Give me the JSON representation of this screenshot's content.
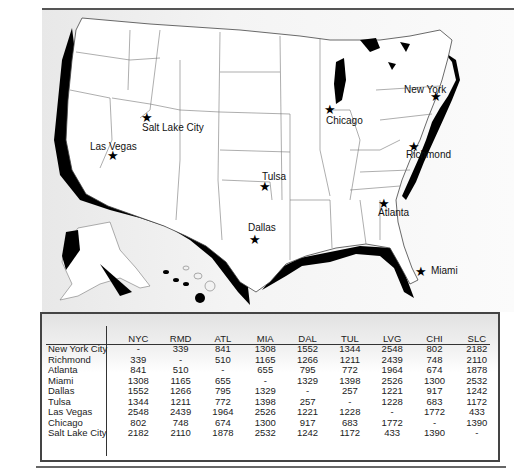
{
  "map": {
    "cities": [
      {
        "name": "Salt Lake City",
        "label_x": 142,
        "label_y": 128,
        "star_x": 147,
        "star_y": 117
      },
      {
        "name": "Las Vegas",
        "label_x": 90,
        "label_y": 147,
        "star_x": 113,
        "star_y": 155
      },
      {
        "name": "Chicago",
        "label_x": 326,
        "label_y": 121,
        "star_x": 330,
        "star_y": 109
      },
      {
        "name": "New York",
        "label_x": 404,
        "label_y": 90,
        "star_x": 436,
        "star_y": 96
      },
      {
        "name": "Richmond",
        "label_x": 406,
        "label_y": 155,
        "star_x": 414,
        "star_y": 146
      },
      {
        "name": "Tulsa",
        "label_x": 262,
        "label_y": 177,
        "star_x": 265,
        "star_y": 186
      },
      {
        "name": "Atlanta",
        "label_x": 378,
        "label_y": 213,
        "star_x": 384,
        "star_y": 203
      },
      {
        "name": "Dallas",
        "label_x": 248,
        "label_y": 228,
        "star_x": 255,
        "star_y": 239
      },
      {
        "name": "Miami",
        "label_x": 431,
        "label_y": 271,
        "star_x": 421,
        "star_y": 271
      }
    ]
  },
  "table": {
    "columns": [
      "NYC",
      "RMD",
      "ATL",
      "MIA",
      "DAL",
      "TUL",
      "LVG",
      "CHI",
      "SLC"
    ],
    "rows": [
      {
        "label": "New York City",
        "values": [
          "-",
          "339",
          "841",
          "1308",
          "1552",
          "1344",
          "2548",
          "802",
          "2182"
        ]
      },
      {
        "label": "Richmond",
        "values": [
          "339",
          "-",
          "510",
          "1165",
          "1266",
          "1211",
          "2439",
          "748",
          "2110"
        ]
      },
      {
        "label": "Atlanta",
        "values": [
          "841",
          "510",
          "-",
          "655",
          "795",
          "772",
          "1964",
          "674",
          "1878"
        ]
      },
      {
        "label": "Miami",
        "values": [
          "1308",
          "1165",
          "655",
          "-",
          "1329",
          "1398",
          "2526",
          "1300",
          "2532"
        ]
      },
      {
        "label": "Dallas",
        "values": [
          "1552",
          "1266",
          "795",
          "1329",
          "-",
          "257",
          "1221",
          "917",
          "1242"
        ]
      },
      {
        "label": "Tulsa",
        "values": [
          "1344",
          "1211",
          "772",
          "1398",
          "257",
          "-",
          "1228",
          "683",
          "1172"
        ]
      },
      {
        "label": "Las Vegas",
        "values": [
          "2548",
          "2439",
          "1964",
          "2526",
          "1221",
          "1228",
          "-",
          "1772",
          "433"
        ]
      },
      {
        "label": "Chicago",
        "values": [
          "802",
          "748",
          "674",
          "1300",
          "917",
          "683",
          "1772",
          "-",
          "1390"
        ]
      },
      {
        "label": "Salt Lake City",
        "values": [
          "2182",
          "2110",
          "1878",
          "2532",
          "1242",
          "1172",
          "433",
          "1390",
          "-"
        ]
      }
    ]
  }
}
